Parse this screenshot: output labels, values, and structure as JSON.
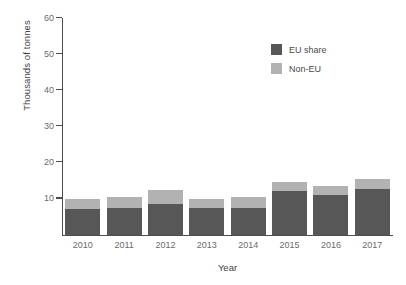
{
  "chart_data": {
    "type": "bar",
    "stacked": true,
    "title": "",
    "xlabel": "Year",
    "ylabel": "Thousands of tonnes",
    "categories": [
      "2010",
      "2011",
      "2012",
      "2013",
      "2014",
      "2015",
      "2016",
      "2017"
    ],
    "series": [
      {
        "name": "EU share",
        "color": "#575757",
        "values": [
          7,
          7.5,
          8.5,
          7.5,
          7.5,
          12,
          11,
          12.5
        ]
      },
      {
        "name": "Non-EU",
        "color": "#b2b2b2",
        "values": [
          3,
          3,
          4,
          2.5,
          3,
          2.5,
          2.5,
          3
        ]
      }
    ],
    "totals": [
      10,
      10.5,
      12.5,
      10,
      10.5,
      14.5,
      13.5,
      15.5
    ],
    "ylim": [
      0,
      60
    ],
    "yticks": [
      0,
      10,
      20,
      30,
      40,
      50,
      60
    ],
    "ytick_labels": [
      "",
      "10",
      "20",
      "30",
      "40",
      "50",
      "60"
    ],
    "grid": false,
    "legend_position": "upper-right"
  },
  "legend": {
    "items": [
      {
        "label": "EU share",
        "color": "#575757"
      },
      {
        "label": "Non-EU",
        "color": "#b2b2b2"
      }
    ]
  },
  "axes": {
    "x_title": "Year",
    "y_title": "Thousands of tonnes"
  }
}
